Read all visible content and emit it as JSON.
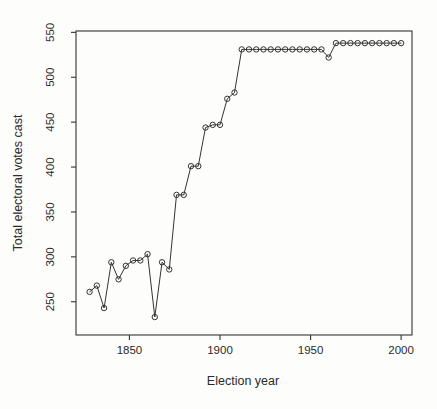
{
  "figure": {
    "background": "#fdfdfc",
    "stroke_color": "#333333",
    "text_color": "#2b2b2b",
    "marker": "open-circle"
  },
  "chart_data": {
    "type": "line",
    "title": "",
    "xlabel": "Election year",
    "ylabel": "Total electoral votes cast",
    "x": [
      1828,
      1832,
      1836,
      1840,
      1844,
      1848,
      1852,
      1856,
      1860,
      1864,
      1868,
      1872,
      1876,
      1880,
      1884,
      1888,
      1892,
      1896,
      1900,
      1904,
      1908,
      1912,
      1916,
      1920,
      1924,
      1928,
      1932,
      1936,
      1940,
      1944,
      1948,
      1952,
      1956,
      1960,
      1964,
      1968,
      1972,
      1976,
      1980,
      1984,
      1988,
      1992,
      1996,
      2000
    ],
    "values": [
      261,
      268,
      243,
      294,
      275,
      290,
      296,
      296,
      303,
      233,
      294,
      286,
      369,
      369,
      401,
      401,
      444,
      447,
      447,
      476,
      483,
      531,
      531,
      531,
      531,
      531,
      531,
      531,
      531,
      531,
      531,
      531,
      531,
      522,
      538,
      538,
      538,
      538,
      538,
      538,
      538,
      538,
      538,
      538
    ],
    "x_ticks": [
      1850,
      1900,
      1950,
      2000
    ],
    "y_ticks": [
      250,
      300,
      350,
      400,
      450,
      500,
      550
    ],
    "xlim": [
      1820.5,
      2006
    ],
    "ylim": [
      213,
      551.5
    ],
    "grid": false,
    "box": true,
    "legend": "none"
  }
}
